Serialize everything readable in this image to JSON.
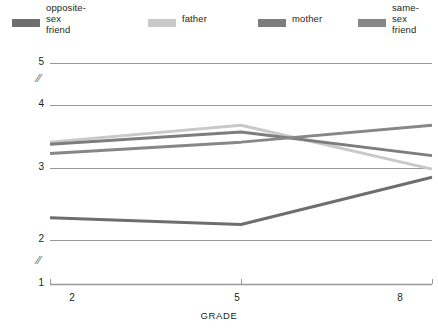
{
  "chart_data": {
    "type": "line",
    "title": "",
    "xlabel": "GRADE",
    "ylabel": "MEAN RATINGS OF COMPANIONSHIP",
    "x": [
      2,
      5,
      8
    ],
    "xtick_labels": [
      "2",
      "5",
      "8"
    ],
    "ytick_labels": [
      "1",
      "2",
      "3",
      "4",
      "5"
    ],
    "ylim": [
      1,
      5
    ],
    "y_axis_breaks": [
      "between 1 and 2",
      "between 4 and 5"
    ],
    "grid": true,
    "grid_orientation": "horizontal",
    "legend_position": "top",
    "series": [
      {
        "name": "opposite-sex\nfriend",
        "color": "#6e6e6e",
        "values": [
          2.33,
          2.23,
          2.93
        ]
      },
      {
        "name": "father",
        "color": "#c9c9c9",
        "values": [
          3.45,
          3.7,
          3.05
        ]
      },
      {
        "name": "mother",
        "color": "#7d7d7d",
        "values": [
          3.42,
          3.6,
          3.25
        ]
      },
      {
        "name": "same-sex\nfriend",
        "color": "#878787",
        "values": [
          3.28,
          3.45,
          3.7
        ]
      }
    ]
  },
  "legend": {
    "items": [
      {
        "label": "opposite-sex\nfriend",
        "color": "#6e6e6e"
      },
      {
        "label": "father",
        "color": "#c9c9c9"
      },
      {
        "label": "mother",
        "color": "#7d7d7d"
      },
      {
        "label": "same-sex\nfriend",
        "color": "#878787"
      }
    ]
  },
  "axes": {
    "y_title": "MEAN RATINGS OF COMPANIONSHIP",
    "x_title": "GRADE",
    "y_ticks": [
      "5",
      "4",
      "3",
      "2",
      "1"
    ],
    "x_ticks": [
      "2",
      "5",
      "8"
    ],
    "break_glyph": "//"
  },
  "colors": {
    "axis": "#9a9a9a",
    "grid": "#9a9a9a",
    "text": "#231f20",
    "background": "#ffffff"
  }
}
